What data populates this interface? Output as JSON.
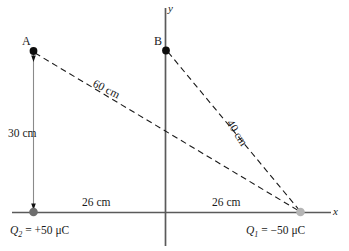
{
  "figure": {
    "axes": {
      "x_label": "x",
      "y_label": "y",
      "axis_color": "#5a5a5a"
    },
    "points": [
      {
        "id": "A",
        "label": "A",
        "marker": "filled-black-dot"
      },
      {
        "id": "B",
        "label": "B",
        "marker": "filled-black-dot"
      }
    ],
    "charges": [
      {
        "id": "Q2",
        "label": "Q",
        "subscript": "2",
        "equals": "=",
        "value": "+50",
        "unit": "μC",
        "full": "Q2 = +50 μC",
        "marker": "dark-gray-dot",
        "color": "#6e6e6e"
      },
      {
        "id": "Q1",
        "label": "Q",
        "subscript": "1",
        "equals": "=",
        "value": "−50",
        "unit": "μC",
        "full": "Q1 = −50 μC",
        "marker": "light-gray-dot",
        "color": "#b0b0b0"
      }
    ],
    "dimensions": [
      {
        "id": "vertical-A",
        "text": "30 cm"
      },
      {
        "id": "diagonal-A-Q1",
        "text": "60 cm"
      },
      {
        "id": "diagonal-B-Q1",
        "text": "40 cm"
      },
      {
        "id": "horizontal-left",
        "text": "26 cm"
      },
      {
        "id": "horizontal-right",
        "text": "26 cm"
      }
    ],
    "colors": {
      "line": "#1a1a1a",
      "axis": "#5a5a5a",
      "dot_dark": "#6e6e6e",
      "dot_light": "#b5b5b5",
      "point_dot": "#0d0d0d",
      "background": "#ffffff"
    }
  }
}
